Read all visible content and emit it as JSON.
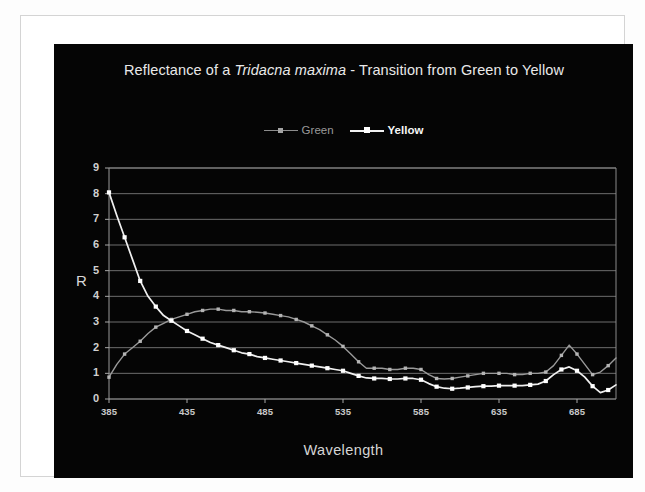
{
  "figure": {
    "background": "#050505",
    "page_background": "#ffffff",
    "frame_border": "#d4d4d4"
  },
  "chart_data": {
    "type": "line",
    "title": "Reflectance of a Tridacna maxima  - Transition from Green to Yellow",
    "title_parts": {
      "before": "Reflectance of a ",
      "italic": "Tridacna maxima",
      "after": " - Transition from Green to Yellow"
    },
    "xlabel": "Wavelength",
    "ylabel": "R",
    "xlim": [
      385,
      710
    ],
    "ylim": [
      0,
      9
    ],
    "xticks": [
      385,
      435,
      485,
      535,
      585,
      635,
      685
    ],
    "yticks": [
      0,
      1,
      2,
      3,
      4,
      5,
      6,
      7,
      8,
      9
    ],
    "grid": "horizontal",
    "legend_position": "top-center",
    "x": [
      385,
      390,
      395,
      400,
      405,
      410,
      415,
      420,
      425,
      430,
      435,
      440,
      445,
      450,
      455,
      460,
      465,
      470,
      475,
      480,
      485,
      490,
      495,
      500,
      505,
      510,
      515,
      520,
      525,
      530,
      535,
      540,
      545,
      550,
      555,
      560,
      565,
      570,
      575,
      580,
      585,
      590,
      595,
      600,
      605,
      610,
      615,
      620,
      625,
      630,
      635,
      640,
      645,
      650,
      655,
      660,
      665,
      670,
      675,
      680,
      685,
      690,
      695,
      700,
      705,
      710
    ],
    "series": [
      {
        "name": "Green",
        "color": "#9a9a9a",
        "marker_color": "#b4b4b4",
        "values": [
          0.85,
          1.35,
          1.75,
          2.0,
          2.25,
          2.55,
          2.8,
          2.95,
          3.1,
          3.2,
          3.3,
          3.4,
          3.45,
          3.5,
          3.5,
          3.45,
          3.45,
          3.4,
          3.4,
          3.38,
          3.35,
          3.3,
          3.25,
          3.2,
          3.1,
          3.0,
          2.85,
          2.7,
          2.5,
          2.3,
          2.05,
          1.75,
          1.45,
          1.2,
          1.2,
          1.2,
          1.15,
          1.15,
          1.2,
          1.2,
          1.15,
          0.95,
          0.8,
          0.78,
          0.8,
          0.85,
          0.9,
          0.95,
          1.0,
          1.0,
          1.0,
          1.0,
          0.95,
          0.95,
          1.0,
          1.0,
          1.05,
          1.3,
          1.7,
          2.1,
          1.75,
          1.35,
          0.95,
          1.05,
          1.3,
          1.6
        ]
      },
      {
        "name": "Yellow",
        "color": "#f0f0f0",
        "marker_color": "#ffffff",
        "values": [
          8.05,
          7.15,
          6.3,
          5.45,
          4.6,
          4.0,
          3.6,
          3.25,
          3.05,
          2.85,
          2.65,
          2.5,
          2.35,
          2.2,
          2.1,
          2.0,
          1.9,
          1.8,
          1.75,
          1.65,
          1.6,
          1.55,
          1.5,
          1.45,
          1.4,
          1.35,
          1.3,
          1.25,
          1.2,
          1.15,
          1.1,
          1.0,
          0.9,
          0.82,
          0.8,
          0.8,
          0.78,
          0.78,
          0.8,
          0.8,
          0.75,
          0.6,
          0.48,
          0.42,
          0.4,
          0.42,
          0.45,
          0.48,
          0.5,
          0.5,
          0.52,
          0.52,
          0.52,
          0.52,
          0.55,
          0.58,
          0.7,
          0.95,
          1.15,
          1.25,
          1.1,
          0.85,
          0.5,
          0.25,
          0.35,
          0.55
        ]
      }
    ]
  },
  "legend": {
    "items": [
      {
        "label": "Green"
      },
      {
        "label": "Yellow"
      }
    ]
  }
}
